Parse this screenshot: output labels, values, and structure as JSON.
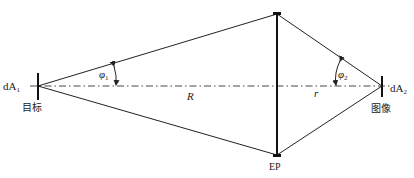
{
  "diagram": {
    "type": "optical-geometry",
    "labels": {
      "dA1": "dA",
      "dA1_sub": "1",
      "target": "目标",
      "dA2": "dA",
      "dA2_sub": "2",
      "image": "图像",
      "phi1": "φ",
      "phi1_sub": "1",
      "phi2": "φ",
      "phi2_sub": "2",
      "R": "R",
      "r": "r",
      "EP": "EP"
    },
    "colors": {
      "stroke": "#222222",
      "background": "#ffffff"
    }
  }
}
